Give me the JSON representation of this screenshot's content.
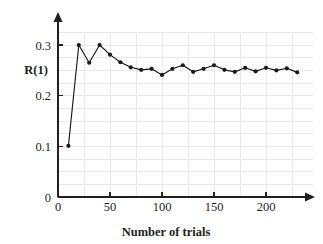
{
  "chart_data": {
    "type": "line",
    "title": "",
    "xlabel": "Number of trials",
    "ylabel": "R(1)",
    "xlim": [
      0,
      245
    ],
    "ylim": [
      0,
      0.325
    ],
    "xticks": [
      0,
      50,
      100,
      150,
      200
    ],
    "yticks": [
      0,
      0.1,
      0.2,
      0.3
    ],
    "xtick_labels": [
      "0",
      "50",
      "100",
      "150",
      "200"
    ],
    "ytick_labels": [
      "0",
      "0.1",
      "0.2",
      "0.3"
    ],
    "grid": true,
    "legend": "none",
    "marker": "filled-circle",
    "line_color": "#1a1a1a",
    "grid_color": "#e9e9e9",
    "axis_color": "#231f20",
    "x": [
      10,
      20,
      30,
      40,
      50,
      60,
      70,
      80,
      90,
      100,
      110,
      120,
      130,
      140,
      150,
      160,
      170,
      180,
      190,
      200,
      210,
      220,
      230
    ],
    "y": [
      0.101,
      0.3,
      0.265,
      0.3,
      0.281,
      0.266,
      0.256,
      0.251,
      0.253,
      0.241,
      0.253,
      0.26,
      0.247,
      0.253,
      0.26,
      0.251,
      0.247,
      0.255,
      0.248,
      0.255,
      0.25,
      0.254,
      0.246
    ],
    "series": [
      {
        "name": "R(1)",
        "values": [
          0.101,
          0.3,
          0.265,
          0.3,
          0.281,
          0.266,
          0.256,
          0.251,
          0.253,
          0.241,
          0.253,
          0.26,
          0.247,
          0.253,
          0.26,
          0.251,
          0.247,
          0.255,
          0.248,
          0.255,
          0.25,
          0.254,
          0.246
        ]
      }
    ]
  }
}
